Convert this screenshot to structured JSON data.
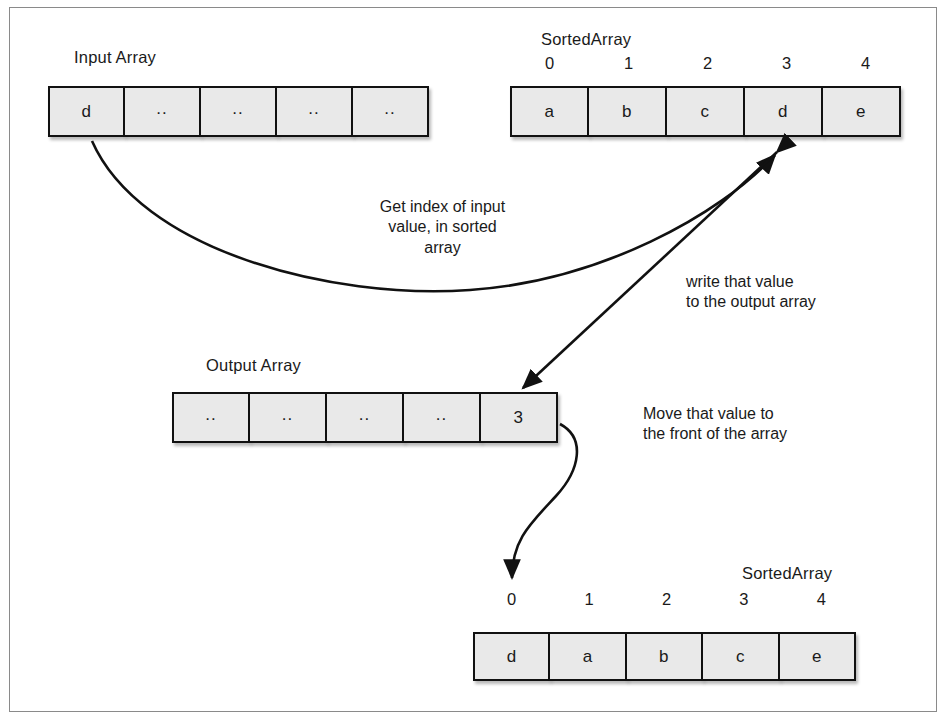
{
  "input_array": {
    "label": "Input Array",
    "cells": [
      "d",
      "..",
      "..",
      "..",
      ".."
    ]
  },
  "sorted_array_top": {
    "label": "SortedArray",
    "indices": [
      "0",
      "1",
      "2",
      "3",
      "4"
    ],
    "cells": [
      "a",
      "b",
      "c",
      "d",
      "e"
    ]
  },
  "output_array": {
    "label": "Output Array",
    "cells": [
      "..",
      "..",
      "..",
      "..",
      "3"
    ]
  },
  "sorted_array_bottom": {
    "label": "SortedArray",
    "indices": [
      "0",
      "1",
      "2",
      "3",
      "4"
    ],
    "cells": [
      "d",
      "a",
      "b",
      "c",
      "e"
    ]
  },
  "notes": {
    "get_index": "Get index of input\nvalue, in sorted\narray",
    "write_value": "write that value\nto the output array",
    "move_value": "Move that value to\nthe front of the array"
  },
  "colors": {
    "cell_fill": "#e9e9e9",
    "cell_stroke": "#111111",
    "frame_stroke": "#8a8a8a",
    "text": "#1a1a1a",
    "arrow": "#111111"
  }
}
